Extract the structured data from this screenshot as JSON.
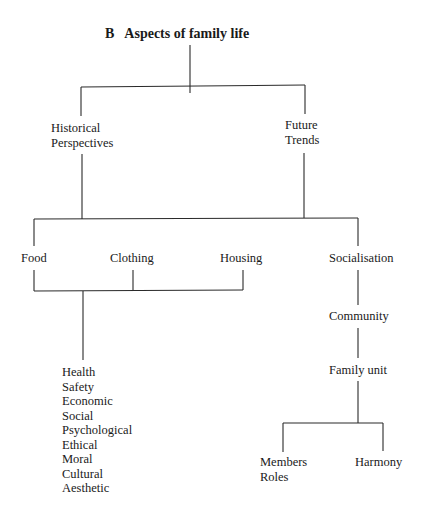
{
  "title": {
    "letter": "B",
    "text": "Aspects of family life"
  },
  "nodes": {
    "historical": {
      "lines": [
        "Historical",
        "Perspectives"
      ]
    },
    "future": {
      "lines": [
        "Future",
        "Trends"
      ]
    },
    "food": "Food",
    "clothing": "Clothing",
    "housing": "Housing",
    "socialisation": "Socialisation",
    "community": "Community",
    "family_unit": "Family unit",
    "members_roles": {
      "lines": [
        "Members",
        "Roles"
      ]
    },
    "harmony": "Harmony",
    "aspects_list": [
      "Health",
      "Safety",
      "Economic",
      "Social",
      "Psychological",
      "Ethical",
      "Moral",
      "Cultural",
      "Aesthetic"
    ]
  },
  "line_color": "#2a2a2a",
  "connectors": [
    [
      190,
      45,
      190,
      93
    ],
    [
      81,
      87,
      305,
      85
    ],
    [
      81,
      87,
      81,
      116
    ],
    [
      305,
      85,
      305,
      114
    ],
    [
      82,
      154,
      82,
      219
    ],
    [
      304,
      153,
      304,
      218
    ],
    [
      34,
      219,
      358,
      218
    ],
    [
      34,
      219,
      34,
      246
    ],
    [
      358,
      218,
      358,
      246
    ],
    [
      34,
      270,
      34,
      291
    ],
    [
      34,
      291,
      243,
      290
    ],
    [
      133,
      270,
      133,
      290
    ],
    [
      243,
      270,
      243,
      290
    ],
    [
      83,
      291,
      83,
      360
    ],
    [
      358,
      270,
      358,
      305
    ],
    [
      358,
      328,
      358,
      358
    ],
    [
      358,
      381,
      358,
      423
    ],
    [
      283,
      423,
      383,
      423
    ],
    [
      283,
      423,
      283,
      452
    ],
    [
      383,
      423,
      383,
      451
    ]
  ]
}
